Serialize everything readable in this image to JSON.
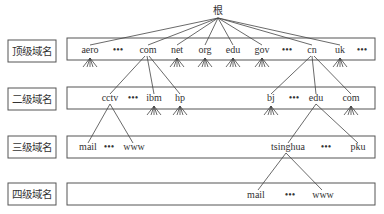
{
  "diagram": {
    "root": {
      "label": "根"
    },
    "levels": [
      {
        "id": "tld",
        "label": "顶级域名",
        "nodes": [
          "aero",
          "•••",
          "com",
          "net",
          "org",
          "edu",
          "gov",
          "•••",
          "cn",
          "uk",
          "•••"
        ]
      },
      {
        "id": "sld",
        "label": "二级域名",
        "nodes": [
          "cctv",
          "•••",
          "ibm",
          "hp",
          "bj",
          "•••",
          "edu",
          "com"
        ]
      },
      {
        "id": "third",
        "label": "三级域名",
        "nodes": [
          "mail",
          "•••",
          "www",
          "tsinghua",
          "•••",
          "pku"
        ]
      },
      {
        "id": "fourth",
        "label": "四级域名",
        "nodes": [
          "mail",
          "•••",
          "www"
        ]
      }
    ],
    "edges": [
      [
        "根",
        "aero"
      ],
      [
        "根",
        "com"
      ],
      [
        "根",
        "net"
      ],
      [
        "根",
        "org"
      ],
      [
        "根",
        "edu"
      ],
      [
        "根",
        "gov"
      ],
      [
        "根",
        "cn"
      ],
      [
        "根",
        "uk"
      ],
      [
        "com",
        "cctv"
      ],
      [
        "com",
        "ibm"
      ],
      [
        "com",
        "hp"
      ],
      [
        "cn",
        "bj"
      ],
      [
        "cn",
        "edu"
      ],
      [
        "cn",
        "com"
      ],
      [
        "cctv",
        "mail"
      ],
      [
        "cctv",
        "www"
      ],
      [
        "edu",
        "tsinghua"
      ],
      [
        "edu",
        "pku"
      ],
      [
        "tsinghua",
        "mail"
      ],
      [
        "tsinghua",
        "www"
      ]
    ]
  }
}
